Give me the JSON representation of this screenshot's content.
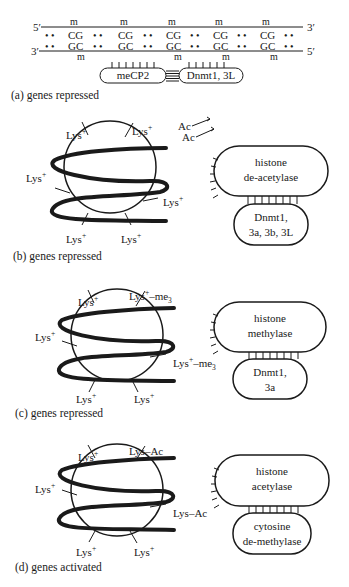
{
  "panel_a": {
    "strand_top": {
      "left_end": "5′",
      "right_end": "3′",
      "repeat": "CG",
      "dots": "• •",
      "methyl": "m"
    },
    "strand_bottom": {
      "left_end": "3′",
      "right_end": "5′",
      "repeat": "GC",
      "dots": "• •",
      "methyl": "m"
    },
    "protein_left": "meCP2",
    "protein_right": "Dnmt1, 3L",
    "caption": "(a) genes repressed"
  },
  "panel_b": {
    "lysine_labels": [
      "Lys",
      "Lys",
      "Lys",
      "Lys",
      "Lys",
      "Lys"
    ],
    "charge": "+",
    "released": [
      "Ac",
      "Ac"
    ],
    "enzyme_top": [
      "histone",
      "de-acetylase"
    ],
    "enzyme_bottom": [
      "Dnmt1,",
      "3a, 3b, 3L"
    ],
    "caption": "(b) genes repressed"
  },
  "panel_c": {
    "lysine_labels": [
      "Lys",
      "Lys",
      "Lys",
      "Lys",
      "Lys",
      "Lys"
    ],
    "charge": "+",
    "modification": "–me",
    "mod_sub": "3",
    "enzyme_top": [
      "histone",
      "methylase"
    ],
    "enzyme_bottom": [
      "Dnmt1,",
      "3a"
    ],
    "caption": "(c) genes repressed"
  },
  "panel_d": {
    "lysine_labels": [
      "Lys",
      "Lys–Ac",
      "Lys",
      "Lys–Ac",
      "Lys",
      "Lys"
    ],
    "charge": "+",
    "enzyme_top": [
      "histone",
      "acetylase"
    ],
    "enzyme_bottom": [
      "cytosine",
      "de-methylase"
    ],
    "caption": "(d) genes activated"
  }
}
